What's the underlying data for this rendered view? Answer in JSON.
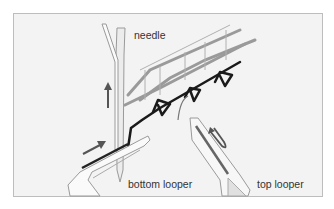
{
  "diagram": {
    "title": "",
    "labels": {
      "needle": "needle",
      "bottom_looper": "bottom looper",
      "top_looper": "top looper"
    },
    "components": [
      {
        "id": "needle",
        "type": "needle",
        "label": "needle"
      },
      {
        "id": "bottom-looper",
        "type": "looper",
        "label": "bottom looper"
      },
      {
        "id": "top-looper",
        "type": "looper",
        "label": "top looper"
      },
      {
        "id": "thread-dark",
        "type": "thread",
        "color": "#1a1a1a"
      },
      {
        "id": "thread-gray",
        "type": "thread",
        "color": "#8a8a8a"
      },
      {
        "id": "arrow-needle-up",
        "type": "arrow",
        "direction": "up"
      },
      {
        "id": "arrow-bottom-looper",
        "type": "arrow",
        "direction": "up-right"
      },
      {
        "id": "arrow-top-looper",
        "type": "arrow",
        "direction": "u-turn"
      }
    ],
    "colors": {
      "panel_bg": "#f3f3f3",
      "panel_border": "#bdbdbd",
      "dark_thread": "#1a1a1a",
      "gray_thread": "#8a8a8a",
      "arrow": "#555555"
    }
  }
}
